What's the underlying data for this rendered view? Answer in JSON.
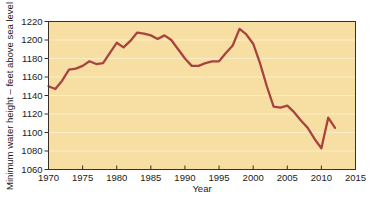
{
  "chart_data": {
    "type": "line",
    "title": "",
    "xlabel": "Year",
    "ylabel": "Minimum water height – feet above sea level",
    "xlim": [
      1970,
      2015
    ],
    "ylim": [
      1060,
      1220
    ],
    "xticks": [
      "1970",
      "1975",
      "1980",
      "1985",
      "1990",
      "1995",
      "2000",
      "2005",
      "2010",
      "2015"
    ],
    "yticks": [
      "1060",
      "1080",
      "1100",
      "1120",
      "1140",
      "1160",
      "1180",
      "1200",
      "1220"
    ],
    "grid": "horizontal",
    "legend": "none",
    "line_color": "#a8443f",
    "plot_background": "#f7dfa4",
    "gridline_color": "#fbeec6",
    "axis_color": "#3a3028",
    "series": [
      {
        "name": "Minimum water height",
        "x": [
          1970,
          1971,
          1972,
          1973,
          1974,
          1975,
          1976,
          1977,
          1978,
          1979,
          1980,
          1981,
          1982,
          1983,
          1984,
          1985,
          1986,
          1987,
          1988,
          1989,
          1990,
          1991,
          1992,
          1993,
          1994,
          1995,
          1996,
          1997,
          1998,
          1999,
          2000,
          2001,
          2002,
          2003,
          2004,
          2005,
          2006,
          2007,
          2008,
          2009,
          2010,
          2011,
          2012
        ],
        "values": [
          1150,
          1147,
          1156,
          1168,
          1169,
          1172,
          1177,
          1174,
          1175,
          1186,
          1197,
          1192,
          1199,
          1208,
          1207,
          1205,
          1201,
          1205,
          1200,
          1190,
          1180,
          1172,
          1172,
          1175,
          1177,
          1177,
          1186,
          1194,
          1212,
          1206,
          1196,
          1175,
          1150,
          1128,
          1127,
          1129,
          1122,
          1113,
          1105,
          1093,
          1083,
          1116,
          1105
        ]
      }
    ]
  },
  "axis": {
    "x_title": "Year",
    "y_title": "Minimum water height – feet above sea level"
  }
}
